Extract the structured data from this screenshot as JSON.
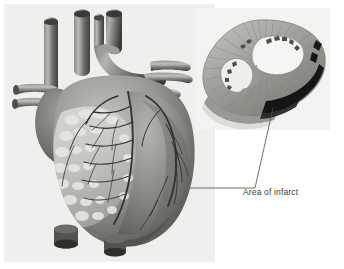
{
  "figure": {
    "title": "Area of infarct",
    "type": "medical-illustration",
    "rendering": "grayscale halftone",
    "width": 344,
    "height": 269
  },
  "colors": {
    "page_background": "#ffffff",
    "panel_background": "#efefee",
    "inset_background": "#f3f3f2",
    "myocardium_light": "#bdbdba",
    "myocardium_mid": "#8e8e8b",
    "myocardium_dark": "#5e5e5c",
    "vessel_dark": "#4a4a48",
    "vessel_mid": "#6f6f6d",
    "vessel_light": "#a6a6a3",
    "epicardial_fat": "#d8d8d4",
    "coronary_artery": "#3a3a38",
    "infarct_black": "#151515",
    "cavity_white": "#f6f6f4",
    "leader_line": "#4a4a48",
    "label_text": "#3b3b3b"
  },
  "labels": {
    "infarct": {
      "text": "Area of infarct",
      "x": 243,
      "y": 187
    }
  },
  "leader_line": {
    "description": "line from heart anterior wall to inset infarct region",
    "points": "117,188 255,188 273,108"
  },
  "heart": {
    "name": "heart-anterior-view",
    "structures": [
      {
        "name": "aorta",
        "label": "Aorta"
      },
      {
        "name": "pulmonary-trunk",
        "label": "Pulmonary trunk"
      },
      {
        "name": "superior-vena-cava",
        "label": "Superior vena cava"
      },
      {
        "name": "pulmonary-veins",
        "label": "Pulmonary veins"
      },
      {
        "name": "right-atrium",
        "label": "Right atrium"
      },
      {
        "name": "right-ventricle",
        "label": "Right ventricle"
      },
      {
        "name": "left-ventricle",
        "label": "Left ventricle"
      },
      {
        "name": "left-atrial-appendage",
        "label": "Left atrial appendage"
      },
      {
        "name": "coronary-arteries",
        "label": "Coronary arteries"
      },
      {
        "name": "epicardial-fat",
        "label": "Epicardial fat"
      },
      {
        "name": "apex",
        "label": "Apex"
      },
      {
        "name": "inferior-vena-cava-stump",
        "label": "Inferior vena cava stump"
      }
    ]
  },
  "inset": {
    "name": "ventricular-cross-section",
    "structures": [
      {
        "name": "myocardium",
        "label": "Myocardium"
      },
      {
        "name": "left-ventricle-cavity",
        "label": "Left ventricular cavity"
      },
      {
        "name": "right-ventricle-cavity",
        "label": "Right ventricular cavity"
      },
      {
        "name": "interventricular-septum",
        "label": "Interventricular septum"
      },
      {
        "name": "infarct-region",
        "label": "Area of infarct"
      },
      {
        "name": "trabeculae",
        "label": "Trabeculae carneae"
      }
    ]
  }
}
